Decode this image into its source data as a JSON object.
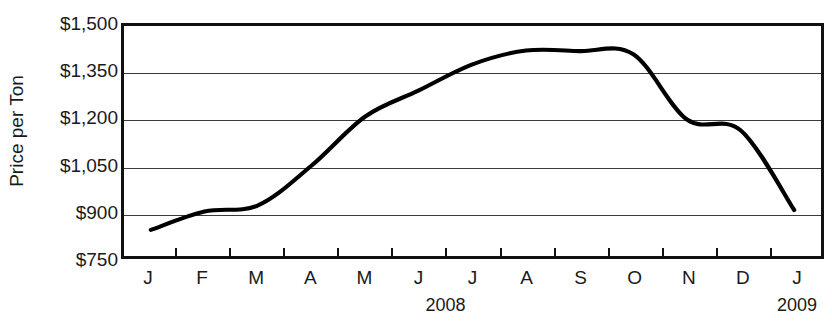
{
  "chart_data": {
    "type": "line",
    "title": "",
    "xlabel": "",
    "ylabel": "Price per Ton",
    "ylim": [
      750,
      1500
    ],
    "yticks": [
      750,
      900,
      1050,
      1200,
      1350,
      1500
    ],
    "ytick_labels": [
      "$750",
      "$900",
      "$1,050",
      "$1,200",
      "$1,350",
      "$1,500"
    ],
    "grid": true,
    "legend": "none",
    "categories": [
      "J",
      "F",
      "M",
      "A",
      "M",
      "J",
      "J",
      "A",
      "S",
      "O",
      "N",
      "D",
      "J"
    ],
    "period_labels": [
      {
        "text": "2008",
        "center_category_index": 5.5
      },
      {
        "text": "2009",
        "center_category_index": 12
      }
    ],
    "series": [
      {
        "name": "Price per Ton",
        "color": "#000000",
        "values": [
          835,
          895,
          915,
          1045,
          1205,
          1290,
          1375,
          1420,
          1418,
          1408,
          1195,
          1160,
          900
        ]
      }
    ],
    "annotations": []
  }
}
